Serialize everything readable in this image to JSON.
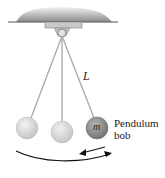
{
  "figure": {
    "length_label": "L",
    "mass_label": "m",
    "bob_label_line1": "Pendulum",
    "bob_label_line2": "bob"
  },
  "colors": {
    "ceiling": "#8a8a8a",
    "string": "#a0a0a0",
    "bob_light": "#d8d8d8",
    "bob_dark": "#8c8c8c",
    "arrow": "#111111"
  }
}
